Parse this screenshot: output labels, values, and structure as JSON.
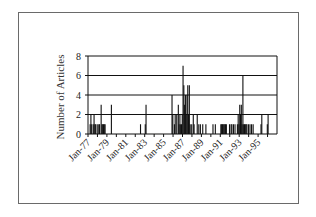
{
  "chart_data": {
    "type": "bar",
    "title": "",
    "xlabel": "",
    "ylabel": "Number of Articles",
    "ylim": [
      0,
      8
    ],
    "yticks": [
      0,
      2,
      4,
      6,
      8
    ],
    "grid": true,
    "legend": null,
    "xtick_labels": [
      "Jan-77",
      "Jan-79",
      "Jan-81",
      "Jan-83",
      "Jan-85",
      "Jan-87",
      "Jan-89",
      "Jan-91",
      "Jan-93",
      "Jan-95"
    ],
    "x_range": [
      "Jan-77",
      "Dec-96"
    ],
    "bars": [
      {
        "x": "Mar-77",
        "value": 1
      },
      {
        "x": "Apr-77",
        "value": 2
      },
      {
        "x": "May-77",
        "value": 1
      },
      {
        "x": "Jul-77",
        "value": 1
      },
      {
        "x": "Aug-77",
        "value": 2
      },
      {
        "x": "Sep-77",
        "value": 1
      },
      {
        "x": "Oct-77",
        "value": 1
      },
      {
        "x": "Dec-77",
        "value": 1
      },
      {
        "x": "Feb-78",
        "value": 1
      },
      {
        "x": "Mar-78",
        "value": 1
      },
      {
        "x": "May-78",
        "value": 3
      },
      {
        "x": "Jun-78",
        "value": 1
      },
      {
        "x": "Jul-78",
        "value": 1
      },
      {
        "x": "Aug-78",
        "value": 1
      },
      {
        "x": "Sep-78",
        "value": 1
      },
      {
        "x": "Oct-78",
        "value": 1
      },
      {
        "x": "Jun-79",
        "value": 3
      },
      {
        "x": "Jul-82",
        "value": 1
      },
      {
        "x": "Jan-83",
        "value": 1
      },
      {
        "x": "Feb-83",
        "value": 3
      },
      {
        "x": "Nov-85",
        "value": 4
      },
      {
        "x": "Dec-85",
        "value": 2
      },
      {
        "x": "Feb-86",
        "value": 1
      },
      {
        "x": "Mar-86",
        "value": 2
      },
      {
        "x": "May-86",
        "value": 2
      },
      {
        "x": "Jul-86",
        "value": 3
      },
      {
        "x": "Aug-86",
        "value": 1
      },
      {
        "x": "Sep-86",
        "value": 2
      },
      {
        "x": "Oct-86",
        "value": 1
      },
      {
        "x": "Nov-86",
        "value": 1
      },
      {
        "x": "Dec-86",
        "value": 2
      },
      {
        "x": "Jan-87",
        "value": 7
      },
      {
        "x": "Feb-87",
        "value": 5
      },
      {
        "x": "Mar-87",
        "value": 3
      },
      {
        "x": "Apr-87",
        "value": 4
      },
      {
        "x": "May-87",
        "value": 2
      },
      {
        "x": "Jun-87",
        "value": 4
      },
      {
        "x": "Jul-87",
        "value": 5
      },
      {
        "x": "Aug-87",
        "value": 2
      },
      {
        "x": "Sep-87",
        "value": 5
      },
      {
        "x": "Oct-87",
        "value": 1
      },
      {
        "x": "Dec-87",
        "value": 1
      },
      {
        "x": "Feb-88",
        "value": 2
      },
      {
        "x": "Mar-88",
        "value": 1
      },
      {
        "x": "Jul-88",
        "value": 2
      },
      {
        "x": "Sep-88",
        "value": 1
      },
      {
        "x": "Nov-88",
        "value": 1
      },
      {
        "x": "Feb-89",
        "value": 1
      },
      {
        "x": "Jun-89",
        "value": 1
      },
      {
        "x": "Mar-90",
        "value": 1
      },
      {
        "x": "Jun-90",
        "value": 1
      },
      {
        "x": "Jan-91",
        "value": 1
      },
      {
        "x": "Feb-91",
        "value": 1
      },
      {
        "x": "Mar-91",
        "value": 1
      },
      {
        "x": "Apr-91",
        "value": 1
      },
      {
        "x": "May-91",
        "value": 1
      },
      {
        "x": "Jun-91",
        "value": 1
      },
      {
        "x": "Jul-91",
        "value": 1
      },
      {
        "x": "Aug-91",
        "value": 1
      },
      {
        "x": "Dec-91",
        "value": 1
      },
      {
        "x": "Feb-92",
        "value": 1
      },
      {
        "x": "Mar-92",
        "value": 1
      },
      {
        "x": "May-92",
        "value": 1
      },
      {
        "x": "Jul-92",
        "value": 1
      },
      {
        "x": "Oct-92",
        "value": 1
      },
      {
        "x": "Nov-92",
        "value": 2
      },
      {
        "x": "Dec-92",
        "value": 1
      },
      {
        "x": "Jan-93",
        "value": 3
      },
      {
        "x": "Feb-93",
        "value": 2
      },
      {
        "x": "Mar-93",
        "value": 3
      },
      {
        "x": "Apr-93",
        "value": 1
      },
      {
        "x": "May-93",
        "value": 6
      },
      {
        "x": "Jun-93",
        "value": 1
      },
      {
        "x": "Jul-93",
        "value": 1
      },
      {
        "x": "Aug-93",
        "value": 1
      },
      {
        "x": "Sep-93",
        "value": 1
      },
      {
        "x": "Oct-93",
        "value": 1
      },
      {
        "x": "Dec-93",
        "value": 1
      },
      {
        "x": "Feb-94",
        "value": 1
      },
      {
        "x": "Apr-94",
        "value": 1
      },
      {
        "x": "Jun-94",
        "value": 1
      },
      {
        "x": "Apr-95",
        "value": 1
      },
      {
        "x": "May-95",
        "value": 2
      },
      {
        "x": "Dec-95",
        "value": 1
      },
      {
        "x": "Jan-96",
        "value": 2
      }
    ]
  },
  "axis": {
    "y_title": "Number of Articles",
    "y_ticks": [
      "0",
      "2",
      "4",
      "6",
      "8"
    ],
    "x_ticks": [
      "Jan-77",
      "Jan-79",
      "Jan-81",
      "Jan-83",
      "Jan-85",
      "Jan-87",
      "Jan-89",
      "Jan-91",
      "Jan-93",
      "Jan-95"
    ]
  },
  "colors": {
    "bar": "#111111",
    "grid": "#111111",
    "frame": "#6a6a6a",
    "text": "#222222"
  }
}
